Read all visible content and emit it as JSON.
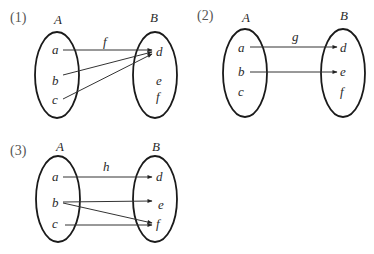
{
  "diagrams": [
    {
      "number": "(1)",
      "map_label": "f",
      "set_a": {
        "label": "A",
        "elements": [
          "a",
          "b",
          "c"
        ]
      },
      "set_b": {
        "label": "B",
        "elements": [
          "d",
          "e",
          "f"
        ]
      },
      "arrows": [
        [
          "a",
          "d"
        ],
        [
          "b",
          "d"
        ],
        [
          "c",
          "d"
        ]
      ]
    },
    {
      "number": "(2)",
      "map_label": "g",
      "set_a": {
        "label": "A",
        "elements": [
          "a",
          "b",
          "c"
        ]
      },
      "set_b": {
        "label": "B",
        "elements": [
          "d",
          "e",
          "f"
        ]
      },
      "arrows": [
        [
          "a",
          "d"
        ],
        [
          "b",
          "e"
        ]
      ]
    },
    {
      "number": "(3)",
      "map_label": "h",
      "set_a": {
        "label": "A",
        "elements": [
          "a",
          "b",
          "c"
        ]
      },
      "set_b": {
        "label": "B",
        "elements": [
          "d",
          "e",
          "f"
        ]
      },
      "arrows": [
        [
          "a",
          "d"
        ],
        [
          "b",
          "e"
        ],
        [
          "b",
          "f"
        ],
        [
          "c",
          "f"
        ]
      ]
    }
  ]
}
